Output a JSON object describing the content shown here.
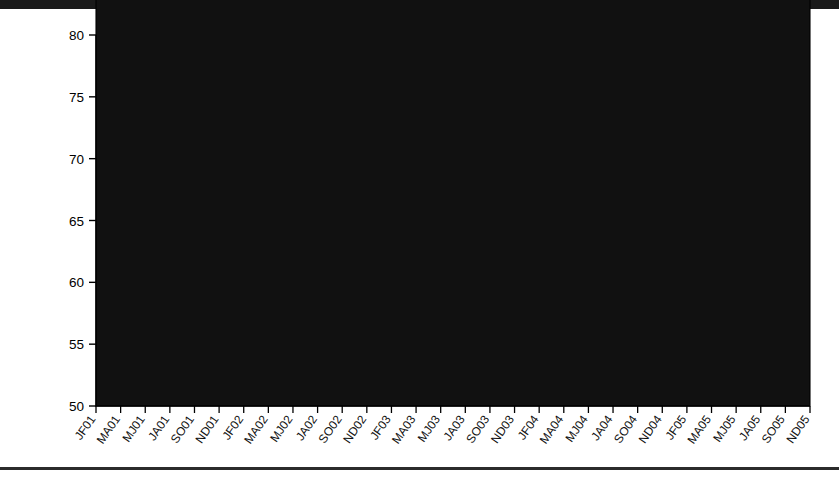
{
  "chart_data": {
    "type": "area",
    "stacked": true,
    "title": "",
    "xlabel": "",
    "ylabel": "% All pads volume",
    "ylim": [
      50,
      80
    ],
    "yticks": [
      50,
      55,
      60,
      65,
      70,
      75,
      80
    ],
    "grid": false,
    "legend_position": "top",
    "categories": [
      "JF01",
      "MA01",
      "MJ01",
      "JA01",
      "SO01",
      "ND01",
      "JF02",
      "MA02",
      "MJ02",
      "JA02",
      "SO02",
      "ND02",
      "JF03",
      "MA03",
      "MJ03",
      "JA03",
      "SO03",
      "ND03",
      "JF04",
      "MA04",
      "MJ04",
      "JA04",
      "SO04",
      "ND04",
      "JF05",
      "MA05",
      "MJ05",
      "JA05",
      "SO05",
      "ND05"
    ],
    "series": [
      {
        "name": "Non-P&G pad brands",
        "fill": "#111111",
        "swatch": "sw-black",
        "values": [
          76.1,
          76.2,
          76.1,
          76.0,
          76.0,
          76.1,
          75.9,
          76.4,
          76.2,
          75.9,
          75.2,
          74.4,
          73.5,
          72.4,
          71.6,
          71.0,
          70.3,
          70.6,
          69.9,
          69.5,
          69.6,
          68.4,
          67.3,
          66.2,
          63.8,
          63.6,
          63.4,
          63.3,
          62.5,
          61.9
        ]
      },
      {
        "name": "Naturella Mexico",
        "fill": "#b9b9b9",
        "swatch": "sw-ltgray",
        "values": [
          0.0,
          0.0,
          0.0,
          0.0,
          0.0,
          0.0,
          0.0,
          0.0,
          0.1,
          0.6,
          1.1,
          1.7,
          2.4,
          3.4,
          4.2,
          4.7,
          5.3,
          4.9,
          5.5,
          5.9,
          5.8,
          5.0,
          4.5,
          4.5,
          5.7,
          5.6,
          5.6,
          5.7,
          6.4,
          6.9
        ]
      },
      {
        "name": "Naturella Venezuela",
        "fill": "#ffffff",
        "pattern": "dots",
        "swatch": "sw-dots",
        "values": [
          0.0,
          0.0,
          0.0,
          0.0,
          0.0,
          0.0,
          0.0,
          0.0,
          0.0,
          0.0,
          0.0,
          0.0,
          0.0,
          0.0,
          0.0,
          0.0,
          0.0,
          0.0,
          0.0,
          0.2,
          0.4,
          0.5,
          0.5,
          0.5,
          0.5,
          0.5,
          0.5,
          0.5,
          0.5,
          0.5
        ]
      },
      {
        "name": "Naturella Russia",
        "fill": "#8d8d8d",
        "swatch": "sw-mdgray",
        "values": [
          0.0,
          0.0,
          0.0,
          0.0,
          0.0,
          0.0,
          0.0,
          0.0,
          0.0,
          0.0,
          0.0,
          0.0,
          0.0,
          0.0,
          0.0,
          0.0,
          0.0,
          0.0,
          0.0,
          0.0,
          0.3,
          1.9,
          3.1,
          4.0,
          4.3,
          4.3,
          4.6,
          4.5,
          4.5,
          4.5
        ]
      },
      {
        "name": "Naturella Poland",
        "fill": "#ffffff",
        "swatch": "sw-white",
        "values": [
          0.0,
          0.0,
          0.0,
          0.0,
          0.0,
          0.0,
          0.0,
          0.0,
          0.0,
          0.0,
          0.0,
          0.0,
          0.0,
          0.0,
          0.0,
          0.0,
          0.0,
          0.0,
          0.0,
          0.1,
          0.6,
          1.6,
          2.2,
          1.9,
          2.4,
          2.0,
          2.6,
          2.3,
          2.4,
          2.2
        ]
      }
    ],
    "totals_top": [
      76.1,
      76.2,
      76.1,
      76.0,
      76.0,
      76.1,
      75.9,
      76.4,
      76.3,
      76.5,
      76.4,
      76.1,
      75.9,
      75.8,
      75.8,
      75.7,
      75.6,
      75.5,
      75.4,
      75.7,
      76.7,
      77.4,
      77.6,
      77.1,
      76.7,
      76.0,
      76.7,
      76.3,
      76.3,
      76.0
    ]
  },
  "legend": {
    "row1": [
      {
        "label": "Non-P&G pad brands",
        "swatch": "sw-black"
      },
      {
        "label": "Naturella Venezuela",
        "swatch": "sw-dots"
      },
      {
        "label": "Naturella Poland",
        "swatch": "sw-white"
      }
    ],
    "row2": [
      {
        "label": "Naturella Mexico",
        "swatch": "sw-ltgray"
      },
      {
        "label": "Naturella Russia",
        "swatch": "sw-mdgray"
      }
    ]
  },
  "axis": {
    "y_title": "% All pads volume"
  },
  "colors": {
    "non_pg": "#111111",
    "mexico": "#b9b9b9",
    "venezuela": "#ffffff",
    "russia": "#8d8d8d",
    "poland": "#ffffff",
    "frame": "#000000"
  }
}
